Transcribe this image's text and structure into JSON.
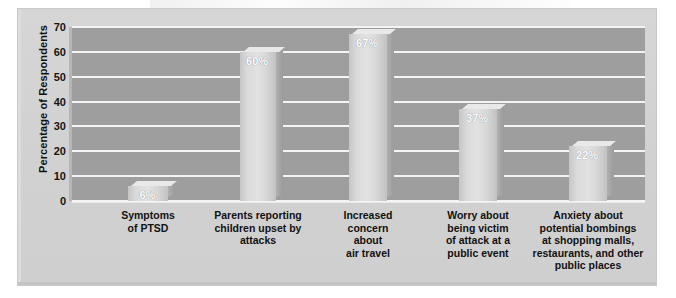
{
  "chart_data": {
    "type": "bar",
    "title": "",
    "subtitle": "",
    "xlabel": "",
    "ylabel": "Percentage of Respondents",
    "ylim": [
      0,
      70
    ],
    "ytick_labels": [
      "0",
      "10",
      "20",
      "30",
      "40",
      "50",
      "60",
      "70"
    ],
    "ytick_values": [
      0,
      10,
      20,
      30,
      40,
      50,
      60,
      70
    ],
    "grid": true,
    "legend": "none",
    "value_suffix": "%",
    "categories": [
      "Symptoms\nof PTSD",
      "Parents reporting\nchildren upset by\nattacks",
      "Increased\nconcern\nabout\nair travel",
      "Worry about\nbeing victim\nof attack at a\npublic event",
      "Anxiety about\npotential bombings\nat shopping malls,\nrestaurants, and other\npublic places"
    ],
    "values": [
      6,
      60,
      67,
      37,
      22
    ],
    "data_labels": [
      "6%",
      "60%",
      "67%",
      "37%",
      "22%"
    ],
    "colors": {
      "bar_face": "#e0e0e0",
      "bar_side": "#a4a4a4",
      "plot_background": "#9e9e9e",
      "gridline": "#f4f4f4",
      "frame_background": "#d2d2d2",
      "text": "#121212",
      "value_label_text": "#ffffff"
    }
  }
}
